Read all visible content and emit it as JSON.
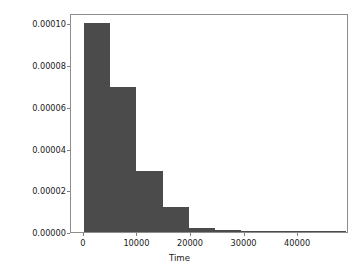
{
  "chart_data": {
    "type": "bar",
    "subtype": "histogram",
    "title": "",
    "xlabel": "Time",
    "ylabel": "",
    "xlim": [
      -2400,
      49500
    ],
    "ylim": [
      0.0,
      0.000105
    ],
    "grid": false,
    "legend": null,
    "bar_color": "#4b4b4b",
    "bin_width": 4900,
    "bin_edges": [
      0,
      4900,
      9800,
      14700,
      19600,
      24500,
      29400,
      34300,
      39200,
      44100,
      49000
    ],
    "bin_centers": [
      2450,
      7350,
      12250,
      17150,
      22050,
      26950,
      31850,
      36750,
      41650,
      46550
    ],
    "values": [
      0.0001,
      6.96e-05,
      2.94e-05,
      1.22e-05,
      1.9e-06,
      9e-07,
      3e-07,
      2e-07,
      1e-07,
      1e-07
    ],
    "xticks": [
      0,
      10000,
      20000,
      30000,
      40000
    ],
    "xticklabels": [
      "0",
      "10000",
      "20000",
      "30000",
      "40000"
    ],
    "yticks": [
      0.0,
      2e-05,
      4e-05,
      6e-05,
      8e-05,
      0.0001
    ],
    "yticklabels": [
      "0.00000",
      "0.00002",
      "0.00004",
      "0.00006",
      "0.00008",
      "0.00010"
    ]
  }
}
